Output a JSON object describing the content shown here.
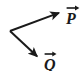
{
  "figure": {
    "type": "vector-diagram",
    "width": 82,
    "height": 71,
    "background_color": "#ffffff",
    "stroke_color": "#1a1a1a"
  },
  "geometry": {
    "origin": {
      "x": 10,
      "y": 31
    },
    "vectors": [
      {
        "name": "P",
        "label": "P",
        "accent": "right-arrow-overbar",
        "tail": {
          "x": 10,
          "y": 31
        },
        "tip": {
          "x": 64,
          "y": 11
        },
        "direction": "up-right",
        "stroke_width": 2
      },
      {
        "name": "Q",
        "label": "Q",
        "accent": "right-arrow-overbar",
        "tail": {
          "x": 10,
          "y": 31
        },
        "tip": {
          "x": 41,
          "y": 60
        },
        "direction": "down-right",
        "stroke_width": 2
      }
    ]
  },
  "labels": {
    "p": {
      "text": "P",
      "accent_name": "vector-arrow-accent",
      "position": {
        "x": 66,
        "y": 5
      }
    },
    "q": {
      "text": "Q",
      "accent_name": "vector-arrow-accent",
      "position": {
        "x": 44,
        "y": 51
      }
    }
  }
}
